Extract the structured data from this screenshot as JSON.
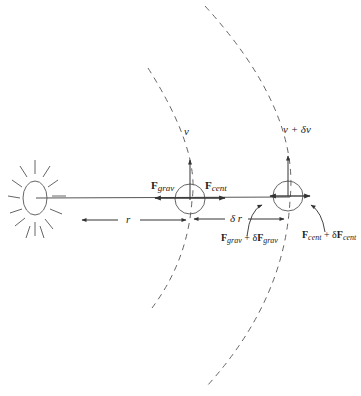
{
  "diagram": {
    "colors": {
      "line": "#555555",
      "dash": "#666666",
      "text": "#222222",
      "background": "#ffffff"
    },
    "sun": {
      "label": "",
      "icon": "sun-icon"
    },
    "inner_orbit": {
      "velocity_label": "v",
      "force_left": {
        "base": "F",
        "sub": "grav"
      },
      "force_right": {
        "base": "F",
        "sub": "cent"
      }
    },
    "outer_orbit": {
      "velocity_label": "v + δv",
      "force_left": {
        "base": "F",
        "sub": "grav",
        "plus": " + δ",
        "base2": "F",
        "sub2": "grav"
      },
      "force_right": {
        "base": "F",
        "sub": "cent",
        "plus": " + δ",
        "base2": "F",
        "sub2": "cent"
      }
    },
    "dimensions": {
      "r_label": "r",
      "dr_label": "δ r"
    }
  }
}
